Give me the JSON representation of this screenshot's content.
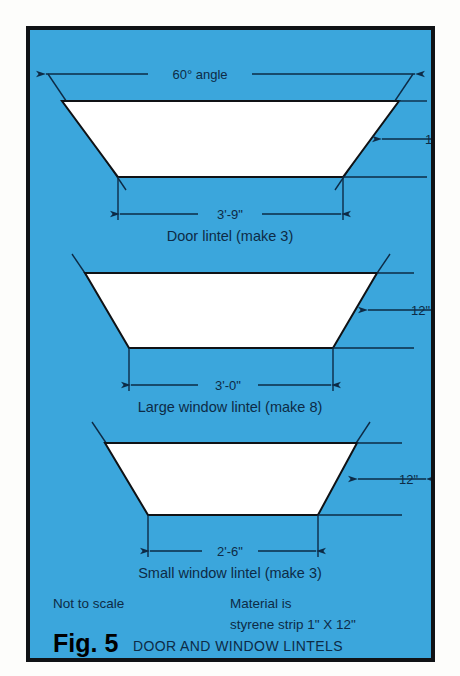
{
  "figure": {
    "number_label": "Fig. 5",
    "title": "DOOR AND WINDOW LINTELS",
    "panel_color": "#3ba6dc",
    "ink_color": "#0d2b46",
    "shape_fill": "#ffffff",
    "border_color": "#101215"
  },
  "notes": {
    "scale_note": "Not to scale",
    "material_line1": "Material is",
    "material_line2": "styrene strip 1\" X 12\""
  },
  "angle_label": "60° angle",
  "lintels": [
    {
      "name": "door-lintel",
      "caption": "Door lintel (make 3)",
      "top_width_label": "60° angle",
      "bottom_width_label": "3'-9\"",
      "height_label": "12\"",
      "top_width_px": 318,
      "bottom_width_px": 233,
      "height_px": 76
    },
    {
      "name": "large-window-lintel",
      "caption": "Large window lintel (make 8)",
      "bottom_width_label": "3'-0\"",
      "height_label": "12\"",
      "top_width_px": 288,
      "bottom_width_px": 205,
      "height_px": 75
    },
    {
      "name": "small-window-lintel",
      "caption": "Small window lintel (make 3)",
      "bottom_width_label": "2'-6\"",
      "height_label": "12\"",
      "top_width_px": 250,
      "bottom_width_px": 170,
      "height_px": 72
    }
  ]
}
